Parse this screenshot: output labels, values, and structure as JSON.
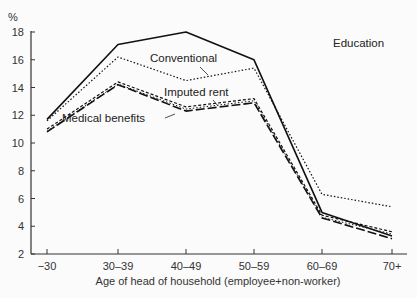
{
  "chart_data": {
    "type": "line",
    "title": "",
    "xlabel": "Age of head of household (employee+non-worker)",
    "ylabel": "%",
    "ylim": [
      2,
      18
    ],
    "yticks": [
      2,
      4,
      6,
      8,
      10,
      12,
      14,
      16,
      18
    ],
    "categories": [
      "−30",
      "30–39",
      "40–49",
      "50–59",
      "60–69",
      "70+"
    ],
    "grid": false,
    "legend": "inline labels",
    "series": [
      {
        "name": "Education",
        "style": "solid",
        "values": [
          11.7,
          17.1,
          18.0,
          16.0,
          5.0,
          3.3
        ]
      },
      {
        "name": "Conventional",
        "style": "dotted",
        "values": [
          11.6,
          16.2,
          14.5,
          15.4,
          6.3,
          5.4
        ]
      },
      {
        "name": "Imputed rent",
        "style": "dashed-dotted double",
        "values": [
          11.0,
          14.4,
          12.6,
          13.2,
          4.8,
          3.6
        ]
      },
      {
        "name": "Medical benefits",
        "style": "long-dash",
        "values": [
          10.8,
          14.2,
          12.3,
          12.9,
          4.6,
          3.1
        ]
      }
    ]
  }
}
